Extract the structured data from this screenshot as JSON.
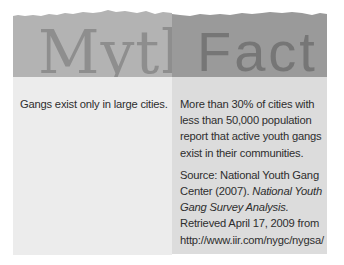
{
  "myth": {
    "heading": "Myth",
    "statement": "Gangs exist only in large cities."
  },
  "fact": {
    "heading": "Fact",
    "statement": "More than 30% of cities with less than 50,000 population report that active youth gangs exist in their communities.",
    "source": {
      "prefix": "Source: National Youth Gang Center (2007). ",
      "title": "National Youth Gang Survey Analysis.",
      "suffix": " Retrieved April 17, 2009 from http://www.iir.com/nygc/nygsa/"
    }
  },
  "colors": {
    "myth_header": "#b3b3b3",
    "fact_header": "#9a9a9a",
    "myth_body": "#ececec",
    "fact_body": "#dcdcdc",
    "text": "#2e2e2e"
  }
}
